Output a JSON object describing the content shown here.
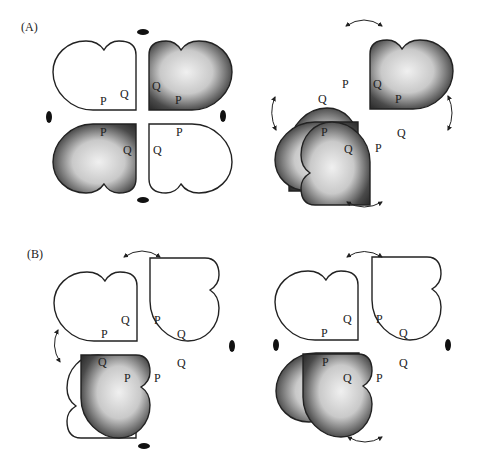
{
  "figure": {
    "panels": [
      {
        "id": "A",
        "label": "(A)",
        "diagrams": [
          {
            "id": "A-left",
            "symmetry": "ellipse-markers",
            "pieces": [
              {
                "position": "top-left",
                "shaded": false,
                "labels": [
                  "Q",
                  "P"
                ]
              },
              {
                "position": "top-right",
                "shaded": true,
                "labels": [
                  "Q",
                  "P"
                ]
              },
              {
                "position": "bottom-left",
                "shaded": true,
                "labels": [
                  "P",
                  "Q"
                ]
              },
              {
                "position": "bottom-right",
                "shaded": false,
                "labels": [
                  "P",
                  "Q"
                ]
              }
            ]
          },
          {
            "id": "A-right",
            "symmetry": "rotation-arrows",
            "pieces": [
              {
                "position": "top-left",
                "shaded": true,
                "labels": [
                  "P",
                  "Q"
                ]
              },
              {
                "position": "top-right",
                "shaded": true,
                "labels": [
                  "Q",
                  "P"
                ]
              },
              {
                "position": "bottom-left",
                "shaded": true,
                "labels": [
                  "P",
                  "Q"
                ]
              },
              {
                "position": "bottom-right",
                "shaded": true,
                "labels": [
                  "Q",
                  "P"
                ]
              }
            ]
          }
        ]
      },
      {
        "id": "B",
        "label": "(B)",
        "diagrams": [
          {
            "id": "B-left",
            "symmetry": "mixed",
            "pieces": [
              {
                "position": "top-left",
                "shaded": false,
                "labels": [
                  "Q",
                  "P"
                ]
              },
              {
                "position": "top-right",
                "shaded": false,
                "labels": [
                  "P",
                  "Q"
                ]
              },
              {
                "position": "bottom-left",
                "shaded": false,
                "labels": [
                  "Q",
                  "P"
                ]
              },
              {
                "position": "bottom-right",
                "shaded": true,
                "labels": [
                  "Q",
                  "P"
                ]
              }
            ]
          },
          {
            "id": "B-right",
            "symmetry": "mixed",
            "pieces": [
              {
                "position": "top-left",
                "shaded": false,
                "labels": [
                  "Q",
                  "P"
                ]
              },
              {
                "position": "top-right",
                "shaded": false,
                "labels": [
                  "P",
                  "Q"
                ]
              },
              {
                "position": "bottom-left",
                "shaded": true,
                "labels": [
                  "P",
                  "Q"
                ]
              },
              {
                "position": "bottom-right",
                "shaded": true,
                "labels": [
                  "Q",
                  "P"
                ]
              }
            ]
          }
        ]
      }
    ],
    "letters": {
      "p": "P",
      "q": "Q"
    },
    "colors": {
      "outline": "#222222",
      "shade_dark": "#2a2a2a",
      "shade_light": "#e8e8e8",
      "background": "#ffffff"
    }
  }
}
